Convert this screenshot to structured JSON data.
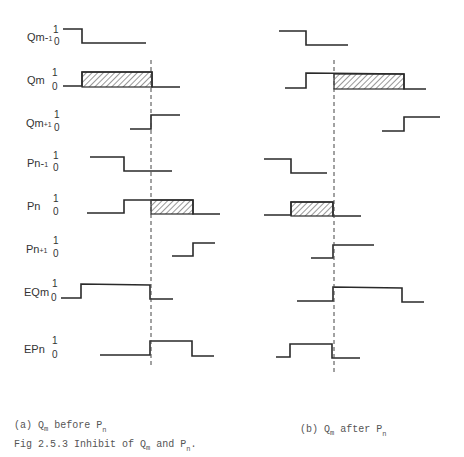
{
  "figure": {
    "caption": "Fig 2.5.3 Inhibit of Qm and Pn.",
    "caption_parts": {
      "prefix": "Fig 2.5.3 Inhibit of Q",
      "sub_m": "m",
      "mid": " and P",
      "sub_n": "n",
      "end": "."
    },
    "panel_a": {
      "caption_prefix": "(a) Q",
      "sub_m": "m",
      "caption_mid": " before P",
      "sub_n": "n"
    },
    "panel_b": {
      "caption_prefix": "(b) Q",
      "sub_m": "m",
      "caption_mid": " after P",
      "sub_n": "n"
    }
  },
  "levels": {
    "high": "1",
    "low": "0"
  },
  "signals": [
    {
      "label": "Qm-1",
      "y_label": 37,
      "y1": 29,
      "y0": 41
    },
    {
      "label": "Qm",
      "y_label": 80,
      "y1": 72,
      "y0": 86
    },
    {
      "label": "Qm+1",
      "y_label": 123,
      "y1": 114,
      "y0": 127
    },
    {
      "label": "Pn-1",
      "y_label": 163,
      "y1": 155,
      "y0": 167
    },
    {
      "label": "Pn",
      "y_label": 206,
      "y1": 198,
      "y0": 211
    },
    {
      "label": "Pn+1",
      "y_label": 249,
      "y1": 240,
      "y0": 253
    },
    {
      "label": "EQm",
      "y_label": 292,
      "y1": 283,
      "y0": 297
    },
    {
      "label": "EPn",
      "y_label": 349,
      "y1": 340,
      "y0": 354
    }
  ],
  "panel_a_waves": [
    {
      "signal": "Qm-1",
      "path": "M63,29 L82,29 L82,43 L146,43"
    },
    {
      "signal": "Qm",
      "path": "M63,86 L82,86 L82,72 L152,72 L152,87 L180,87",
      "hatch": [
        82,
        72,
        152,
        87
      ]
    },
    {
      "signal": "Qm+1",
      "path": "M130,129 L151,129 L151,115 L180,115"
    },
    {
      "signal": "Pn-1",
      "path": "M90,157 L124,157 L124,171 L172,171"
    },
    {
      "signal": "Pn",
      "path": "M87,213 L124,213 L124,200 L193,200 L193,214 L220,214",
      "hatch": [
        151,
        200,
        193,
        214
      ]
    },
    {
      "signal": "Pn+1",
      "path": "M172,256 L193,256 L193,243 L215,243"
    },
    {
      "signal": "EQm",
      "path": "M61,298 L81,298 L81,284 L150,285 L150,299 L173,299"
    },
    {
      "signal": "EPn",
      "path": "M100,355 L150,355 L150,341 L192,341 L192,356 L214,356"
    }
  ],
  "panel_a_dashline": {
    "x": 151,
    "y_start": 60,
    "y_end": 366
  },
  "panel_b_waves": [
    {
      "signal": "Qm-1",
      "path": "M279,31 L306,31 L306,45 L348,45"
    },
    {
      "signal": "Qm",
      "path": "M285,88 L306,88 L306,73 L404,74 L404,89 L426,89",
      "hatch": [
        334,
        74,
        404,
        89
      ]
    },
    {
      "signal": "Qm+1",
      "path": "M382,131 L404,131 L404,117 L440,117"
    },
    {
      "signal": "Pn-1",
      "path": "M264,159 L291,159 L291,173 L327,173"
    },
    {
      "signal": "Pn",
      "path": "M264,215 L291,215 L291,202 L333,202 L333,216 L361,216",
      "hatch": [
        291,
        202,
        333,
        216
      ]
    },
    {
      "signal": "Pn+1",
      "path": "M311,258 L333,258 L333,245 L374,245"
    },
    {
      "signal": "EQm",
      "path": "M297,301 L333,301 L333,287 L402,288 L402,302 L424,302"
    },
    {
      "signal": "EPn",
      "path": "M276,357 L290,357 L290,344 L332,344 L332,358 L360,358"
    }
  ],
  "panel_b_dashline": {
    "x": 334,
    "y_start": 60,
    "y_end": 375
  }
}
